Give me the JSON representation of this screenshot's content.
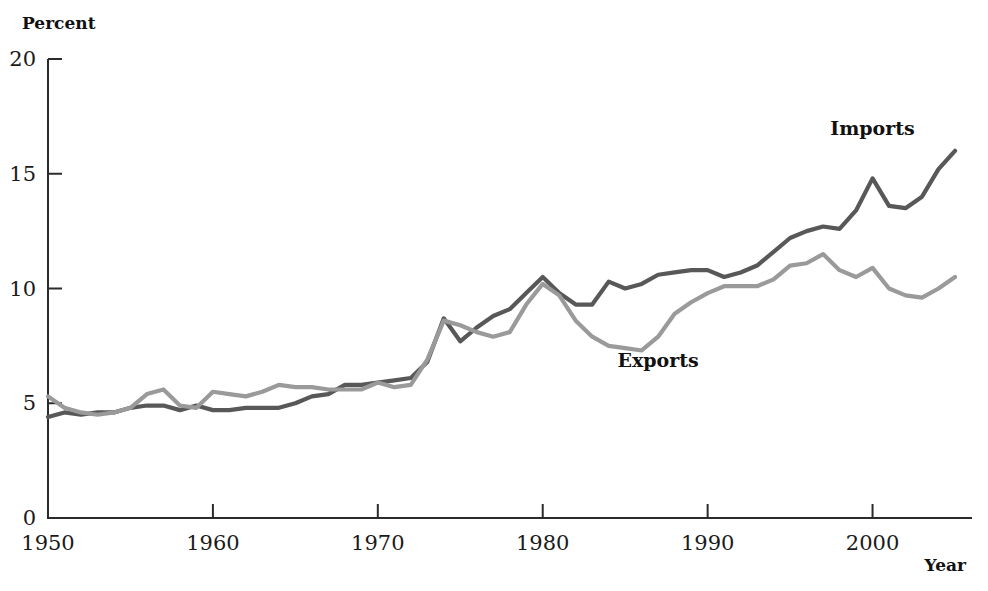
{
  "chart_data": {
    "type": "line",
    "title": "",
    "xlabel": "Year",
    "ylabel": "Percent",
    "xlim": [
      1950,
      2005
    ],
    "ylim": [
      0,
      20
    ],
    "xticks": [
      1950,
      1960,
      1970,
      1980,
      1990,
      2000
    ],
    "yticks": [
      0,
      5,
      10,
      15,
      20
    ],
    "grid": false,
    "legend_position": "inline-annotations",
    "x": [
      1950,
      1951,
      1952,
      1953,
      1954,
      1955,
      1956,
      1957,
      1958,
      1959,
      1960,
      1961,
      1962,
      1963,
      1964,
      1965,
      1966,
      1967,
      1968,
      1969,
      1970,
      1971,
      1972,
      1973,
      1974,
      1975,
      1976,
      1977,
      1978,
      1979,
      1980,
      1981,
      1982,
      1983,
      1984,
      1985,
      1986,
      1987,
      1988,
      1989,
      1990,
      1991,
      1992,
      1993,
      1994,
      1995,
      1996,
      1997,
      1998,
      1999,
      2000,
      2001,
      2002,
      2003,
      2004,
      2005
    ],
    "series": [
      {
        "name": "Imports",
        "color": "#585858",
        "label_x": 2000,
        "label_y": 16.7,
        "values": [
          4.4,
          4.6,
          4.5,
          4.6,
          4.6,
          4.8,
          4.9,
          4.9,
          4.7,
          4.9,
          4.7,
          4.7,
          4.8,
          4.8,
          4.8,
          5.0,
          5.3,
          5.4,
          5.8,
          5.8,
          5.9,
          6.0,
          6.1,
          6.8,
          8.7,
          7.7,
          8.3,
          8.8,
          9.1,
          9.8,
          10.5,
          9.8,
          9.3,
          9.3,
          10.3,
          10.0,
          10.2,
          10.6,
          10.7,
          10.8,
          10.8,
          10.5,
          10.7,
          11.0,
          11.6,
          12.2,
          12.5,
          12.7,
          12.6,
          13.4,
          14.8,
          13.6,
          13.5,
          14.0,
          15.2,
          16.0
        ]
      },
      {
        "name": "Exports",
        "color": "#9a9a9a",
        "label_x": 1987,
        "label_y": 6.6,
        "values": [
          5.3,
          4.8,
          4.6,
          4.5,
          4.6,
          4.8,
          5.4,
          5.6,
          4.9,
          4.8,
          5.5,
          5.4,
          5.3,
          5.5,
          5.8,
          5.7,
          5.7,
          5.6,
          5.6,
          5.6,
          5.9,
          5.7,
          5.8,
          6.9,
          8.6,
          8.4,
          8.1,
          7.9,
          8.1,
          9.3,
          10.2,
          9.7,
          8.6,
          7.9,
          7.5,
          7.4,
          7.3,
          7.9,
          8.9,
          9.4,
          9.8,
          10.1,
          10.1,
          10.1,
          10.4,
          11.0,
          11.1,
          11.5,
          10.8,
          10.5,
          10.9,
          10.0,
          9.7,
          9.6,
          10.0,
          10.5
        ]
      }
    ]
  }
}
